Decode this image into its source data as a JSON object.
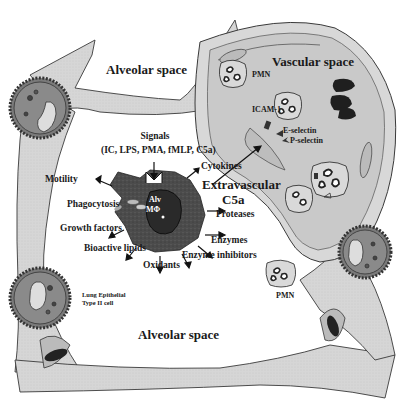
{
  "figure": {
    "regions": {
      "alveolar_space_top": "Alveolar space",
      "alveolar_space_bottom": "Alveolar space",
      "vascular_space": "Vascular space"
    },
    "center_cell": {
      "label_line1": "Alv",
      "label_line2": "MΦ"
    },
    "signals": {
      "title": "Signals",
      "list": "(IC, LPS, PMA, fMLP, C5a)"
    },
    "outputs": {
      "motility": "Motility",
      "phagocytosis": "Phagocytosis",
      "growth_factors": "Growth factors",
      "bioactive_lipids": "Bioactive lipids",
      "oxidants": "Oxidants",
      "enzyme_inhibitors": "Enzyme inhibitors",
      "enzymes": "Enzymes",
      "proteases": "Proteases",
      "cytokines": "Cytokines"
    },
    "extravascular": {
      "line1": "Extravascular",
      "line2": "C5a"
    },
    "adhesion": {
      "icam": "ICAM-1",
      "e_selectin": "E-selectin",
      "p_selectin": "P-selectin"
    },
    "pmn_labels": {
      "vascular": "PMN",
      "alveolar": "PMN"
    },
    "epithelial": {
      "line1": "Lung Epithelial",
      "line2": "Type II cell"
    },
    "colors": {
      "tissue": "#d4d4d4",
      "vascular_fill": "#c8c8c8",
      "outline": "#3a3a3a",
      "macrophage": "#4a4a4a",
      "rbc": "#222222"
    }
  }
}
